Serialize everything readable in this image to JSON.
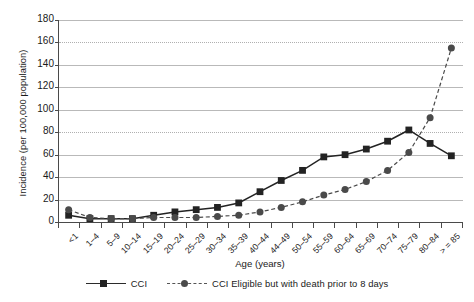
{
  "chart_data": {
    "type": "line",
    "title": "",
    "xlabel": "Age (years)",
    "ylabel": "Incidence (per 100,000 population)",
    "ylim": [
      0,
      180
    ],
    "ytick_step": 20,
    "yticks": [
      0,
      20,
      40,
      60,
      80,
      100,
      120,
      140,
      160,
      180
    ],
    "grid": true,
    "legend_position": "bottom",
    "categories": [
      "<1",
      "1–4",
      "5–9",
      "10–14",
      "15–19",
      "20–24",
      "25–29",
      "30–34",
      "35–39",
      "40–44",
      "44–49",
      "50–54",
      "55–59",
      "60–64",
      "65–69",
      "70–74",
      "75–79",
      "80–84",
      "> = 85"
    ],
    "series": [
      {
        "name": "CCI",
        "marker": "square",
        "linestyle": "solid",
        "color": "#232323",
        "values": [
          6,
          3,
          3,
          3,
          6,
          9,
          11,
          13,
          17,
          27,
          37,
          46,
          58,
          60,
          65,
          72,
          82,
          70,
          59
        ]
      },
      {
        "name": "CCI Eligible but with death prior to 8 days",
        "marker": "circle",
        "linestyle": "dashed",
        "color": "#4a4a4a",
        "values": [
          11,
          4,
          3,
          3,
          4,
          4,
          4,
          5,
          6,
          9,
          13,
          18,
          24,
          29,
          36,
          46,
          62,
          93,
          155
        ]
      }
    ]
  },
  "legend": {
    "items": [
      {
        "label": "CCI",
        "marker": "square-marker",
        "line": "solid-line"
      },
      {
        "label": "CCI Eligible but with death prior to 8 days",
        "marker": "circle-marker",
        "line": "dashed-line"
      }
    ]
  },
  "colors": {
    "series_cci": "#232323",
    "series_cci_eligible": "#4a4a4a",
    "axis": "#4a4a4a",
    "grid": "#b9b9b9",
    "background": "#ffffff"
  }
}
